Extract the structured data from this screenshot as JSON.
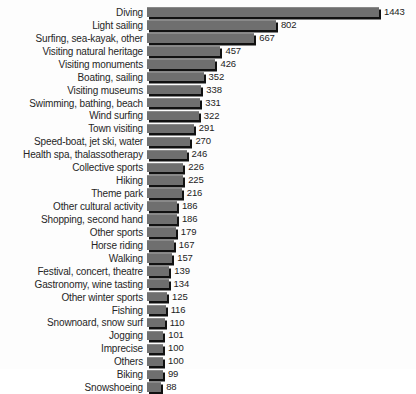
{
  "chart_data": {
    "type": "bar",
    "orientation": "horizontal",
    "title": "",
    "subtitle": "",
    "xlabel": "",
    "ylabel": "",
    "xlim": [
      0,
      1443
    ],
    "grid": false,
    "legend": null,
    "bar_color": "#6f6f6f",
    "shadow_color": "#111111",
    "background": "#fdfdfd",
    "categories": [
      "Diving",
      "Light sailing",
      "Surfing, sea-kayak, other",
      "Visiting natural heritage",
      "Visiting monuments",
      "Boating, sailing",
      "Visiting museums",
      "Swimming, bathing, beach",
      "Wind surfing",
      "Town visiting",
      "Speed-boat,  jet ski, water",
      "Health spa, thalassotherapy",
      "Collective sports",
      "Hiking",
      "Theme park",
      "Other cultural activity",
      "Shopping, second hand",
      "Other sports",
      "Horse riding",
      "Walking",
      "Festival, concert, theatre",
      "Gastronomy, wine tasting",
      "Other winter sports",
      "Fishing",
      "Snownoard, snow surf",
      "Jogging",
      "Imprecise",
      "Others",
      "Biking",
      "Snowshoeing"
    ],
    "values": [
      1443,
      802,
      667,
      457,
      426,
      352,
      338,
      331,
      322,
      291,
      270,
      246,
      226,
      225,
      216,
      186,
      186,
      179,
      167,
      157,
      139,
      134,
      125,
      116,
      110,
      101,
      100,
      100,
      99,
      88
    ]
  }
}
